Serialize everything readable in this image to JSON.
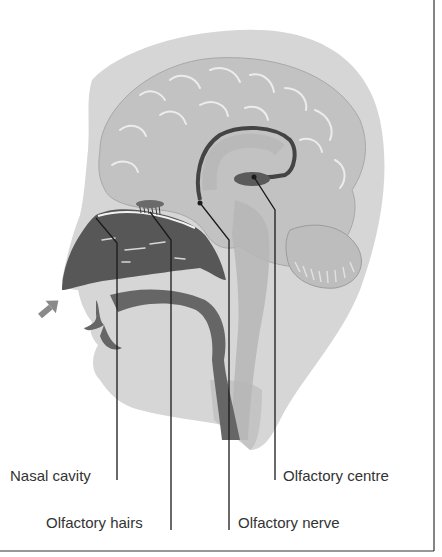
{
  "diagram": {
    "colors": {
      "background": "#ffffff",
      "head": "#d6d6d6",
      "brain": "#c2c2c2",
      "brain_highlight": "#e8e8e8",
      "nasal_cavity": "#5a5a5a",
      "airway": "#6a6a6a",
      "leader_line": "#1a1a1a",
      "border": "#333333",
      "arrow": "#8a8a8a"
    },
    "labels": [
      {
        "id": "nasal-cavity",
        "text": "Nasal cavity"
      },
      {
        "id": "olfactory-hairs",
        "text": "Olfactory hairs"
      },
      {
        "id": "olfactory-nerve",
        "text": "Olfactory nerve"
      },
      {
        "id": "olfactory-centre",
        "text": "Olfactory centre"
      }
    ],
    "icons": {
      "airflow-arrow": "arrow-up-right"
    }
  }
}
